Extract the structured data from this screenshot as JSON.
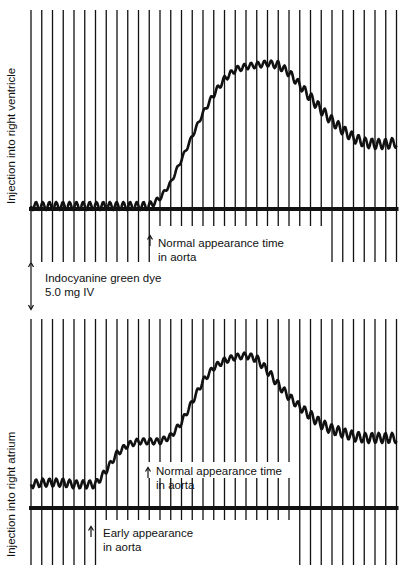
{
  "chart_data": [
    {
      "type": "line",
      "title": "Indicator-dilution curve — Injection into right ventricle",
      "ylabel": "Injection into right ventricle",
      "xlabel": "",
      "grid": "vertical time markers",
      "baseline": "thick horizontal baseline",
      "annotations": [
        {
          "text": "Normal appearance time in aorta",
          "at_marker_index": 11
        }
      ],
      "x_marker_count": 35,
      "x": [
        0,
        1,
        2,
        3,
        4,
        5,
        6,
        7,
        8,
        9,
        10,
        11,
        12,
        13,
        14,
        15,
        16,
        17,
        18,
        19,
        20,
        21,
        22,
        23,
        24,
        25,
        26,
        27,
        28,
        29,
        30,
        31,
        32,
        33,
        34
      ],
      "values": [
        0,
        0,
        0,
        0,
        0,
        0,
        0,
        0,
        0,
        0,
        0,
        0,
        5,
        15,
        30,
        45,
        60,
        72,
        82,
        88,
        90,
        91,
        92,
        91,
        86,
        78,
        70,
        62,
        55,
        49,
        44,
        41,
        40,
        40,
        41
      ],
      "oscillation_amplitude": [
        4,
        4,
        4,
        4,
        4,
        4,
        4,
        4,
        4,
        4,
        4,
        4,
        2,
        2,
        2,
        2,
        2,
        3,
        3,
        3,
        3,
        3,
        3,
        4,
        4,
        4,
        5,
        5,
        5,
        5,
        5,
        5,
        5,
        5,
        5
      ]
    },
    {
      "type": "line",
      "title": "Indicator-dilution curve — Injection into right atrium",
      "ylabel": "Injection into right atrium",
      "xlabel": "",
      "grid": "vertical time markers",
      "baseline": "thick horizontal baseline",
      "annotations": [
        {
          "text": "Normal appearance time in aorta",
          "at_marker_index": 11
        },
        {
          "text": "Early appearance in aorta",
          "at_marker_index": 6
        }
      ],
      "x_marker_count": 35,
      "x": [
        0,
        1,
        2,
        3,
        4,
        5,
        6,
        7,
        8,
        9,
        10,
        11,
        12,
        13,
        14,
        15,
        16,
        17,
        18,
        19,
        20,
        21,
        22,
        23,
        24,
        25,
        26,
        27,
        28,
        29,
        30,
        31,
        32,
        33,
        34
      ],
      "values": [
        12,
        13,
        13,
        13,
        12,
        12,
        12,
        20,
        30,
        35,
        37,
        37,
        37,
        40,
        48,
        60,
        72,
        80,
        84,
        86,
        87,
        85,
        78,
        70,
        63,
        57,
        52,
        47,
        44,
        42,
        40,
        39,
        39,
        39,
        39
      ],
      "oscillation_amplitude": [
        4,
        4,
        4,
        4,
        4,
        4,
        4,
        3,
        3,
        3,
        3,
        3,
        3,
        3,
        3,
        3,
        3,
        3,
        3,
        3,
        3,
        4,
        4,
        4,
        4,
        4,
        5,
        5,
        5,
        5,
        5,
        5,
        5,
        5,
        5
      ]
    }
  ],
  "figure": {
    "top_panel": {
      "ylabel": "Injection into right ventricle",
      "annotation_line1": "Normal appearance time",
      "annotation_line2": "in aorta"
    },
    "middle_note": {
      "line1": "Indocyanine green dye",
      "line2": "5.0 mg IV"
    },
    "bottom_panel": {
      "ylabel": "Injection into right atrium",
      "annotation_normal_line1": "Normal appearance time",
      "annotation_normal_line2": "in aorta",
      "annotation_early_line1": "Early appearance",
      "annotation_early_line2": "in aorta"
    }
  },
  "colors": {
    "ink": "#111111",
    "background": "#ffffff"
  }
}
